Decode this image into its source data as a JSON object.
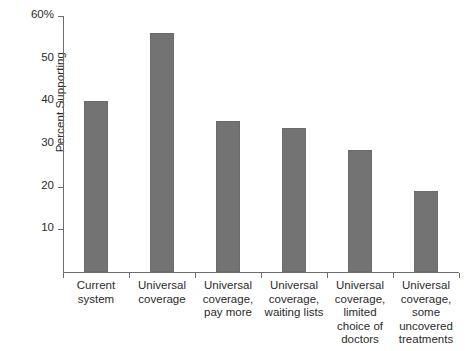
{
  "chart_data": {
    "type": "bar",
    "title": "",
    "xlabel": "",
    "ylabel": "Percent Supporting",
    "categories": [
      "Current\nsystem",
      "Universal\ncoverage",
      "Universal\ncoverage,\npay more",
      "Universal\ncoverage,\nwaiting lists",
      "Universal\ncoverage,\nlimited\nchoice of\ndoctors",
      "Universal\ncoverage,\nsome\nuncovered\ntreatments"
    ],
    "values": [
      40.0,
      56.0,
      35.5,
      33.7,
      28.7,
      19.0
    ],
    "ylim": [
      0,
      60
    ],
    "yticks": [
      10,
      20,
      30,
      40,
      50,
      60
    ],
    "ytick_labels": [
      "10",
      "20",
      "30",
      "40",
      "50",
      "60%"
    ],
    "grid": false,
    "legend": "none",
    "bar_color": "#737373",
    "axis_color": "#6e6e6e",
    "text_color": "#2b2b2b"
  }
}
